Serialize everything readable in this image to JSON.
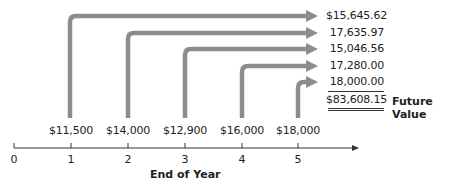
{
  "diagram": {
    "type": "timeline-future-value",
    "cash_flows": [
      {
        "year": "1",
        "amount": "$11,500",
        "future_value": "$15,645.62"
      },
      {
        "year": "2",
        "amount": "$14,000",
        "future_value": "17,635.97"
      },
      {
        "year": "3",
        "amount": "$12,900",
        "future_value": "15,046.56"
      },
      {
        "year": "4",
        "amount": "$16,000",
        "future_value": "17,280.00"
      },
      {
        "year": "5",
        "amount": "$18,000",
        "future_value": "18,000.00"
      }
    ],
    "total": "$83,608.15",
    "total_label": "Future Value",
    "axis_ticks": [
      "0",
      "1",
      "2",
      "3",
      "4",
      "5"
    ],
    "axis_label": "End of Year",
    "arrow_color": "#8c8c8c"
  }
}
